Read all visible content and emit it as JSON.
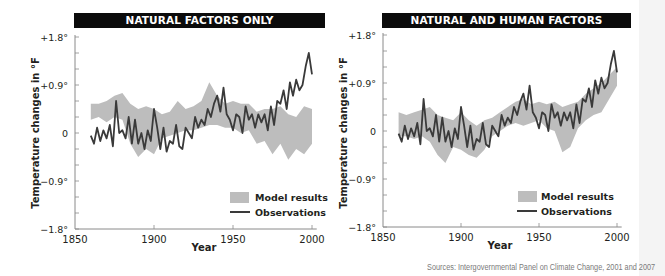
{
  "chart_data": [
    {
      "type": "line",
      "title": "NATURAL FACTORS ONLY",
      "xlabel": "Year",
      "ylabel": "Temperature changes in °F",
      "xlim": [
        1850,
        2005
      ],
      "ylim": [
        -1.8,
        1.8
      ],
      "x_ticks": [
        "1850",
        "1900",
        "1950",
        "2000"
      ],
      "y_ticks": [
        "+1.8°",
        "+0.9°",
        "0",
        "-0.9°",
        "-1.8°"
      ],
      "grid": false,
      "legend": {
        "position": "lower right",
        "entries": [
          "Model results",
          "Observations"
        ]
      },
      "series": [
        {
          "name": "Observations",
          "style": "line",
          "color": "#3a3a3a",
          "x": [
            1860,
            1862,
            1864,
            1866,
            1868,
            1870,
            1872,
            1874,
            1876,
            1878,
            1880,
            1882,
            1884,
            1886,
            1888,
            1890,
            1892,
            1894,
            1896,
            1898,
            1900,
            1902,
            1904,
            1906,
            1908,
            1910,
            1912,
            1914,
            1916,
            1918,
            1920,
            1922,
            1924,
            1926,
            1928,
            1930,
            1932,
            1934,
            1936,
            1938,
            1940,
            1942,
            1944,
            1946,
            1948,
            1950,
            1952,
            1954,
            1956,
            1958,
            1960,
            1962,
            1964,
            1966,
            1968,
            1970,
            1972,
            1974,
            1976,
            1978,
            1980,
            1982,
            1984,
            1986,
            1988,
            1990,
            1992,
            1994,
            1996,
            1998,
            2000
          ],
          "values": [
            -0.05,
            -0.2,
            0.1,
            -0.15,
            0.05,
            -0.1,
            0.15,
            -0.25,
            0.6,
            0.0,
            0.05,
            -0.1,
            0.3,
            -0.2,
            0.25,
            -0.2,
            0.0,
            -0.3,
            0.05,
            -0.15,
            0.45,
            0.1,
            -0.3,
            0.1,
            -0.35,
            -0.15,
            -0.2,
            0.15,
            -0.25,
            -0.3,
            0.1,
            0.0,
            -0.1,
            0.3,
            0.1,
            0.25,
            0.15,
            0.45,
            0.3,
            0.55,
            0.7,
            0.4,
            0.85,
            0.35,
            0.25,
            0.05,
            0.35,
            0.3,
            0.0,
            0.5,
            0.25,
            0.35,
            0.1,
            0.35,
            0.2,
            0.35,
            0.05,
            0.5,
            0.15,
            0.6,
            0.55,
            0.8,
            0.45,
            0.95,
            0.7,
            1.0,
            0.8,
            0.9,
            1.25,
            1.5,
            1.1
          ]
        },
        {
          "name": "Model results",
          "style": "band",
          "color": "#bdbdbd",
          "x": [
            1860,
            1865,
            1870,
            1875,
            1880,
            1885,
            1890,
            1895,
            1900,
            1905,
            1910,
            1915,
            1920,
            1925,
            1930,
            1935,
            1940,
            1945,
            1950,
            1955,
            1960,
            1965,
            1970,
            1975,
            1980,
            1985,
            1990,
            1995,
            2000
          ],
          "upper": [
            0.55,
            0.55,
            0.6,
            0.7,
            0.75,
            0.55,
            0.45,
            0.5,
            0.45,
            0.35,
            0.4,
            0.6,
            0.45,
            0.5,
            0.6,
            0.95,
            0.7,
            0.55,
            0.6,
            0.55,
            0.55,
            0.4,
            0.45,
            0.45,
            0.5,
            0.35,
            0.3,
            0.5,
            0.45
          ],
          "lower": [
            0.25,
            0.3,
            0.2,
            0.3,
            0.25,
            -0.2,
            -0.45,
            -0.3,
            -0.4,
            -0.1,
            -0.05,
            0.0,
            0.05,
            0.05,
            0.1,
            0.15,
            0.15,
            0.1,
            0.1,
            0.0,
            0.05,
            -0.2,
            -0.15,
            -0.4,
            -0.2,
            -0.5,
            -0.3,
            -0.4,
            -0.2
          ]
        }
      ]
    },
    {
      "type": "line",
      "title": "NATURAL AND HUMAN FACTORS",
      "xlabel": "Year",
      "ylabel": "Temperature changes in °F",
      "xlim": [
        1850,
        2005
      ],
      "ylim": [
        -1.8,
        1.8
      ],
      "x_ticks": [
        "1850",
        "1900",
        "1950",
        "2000"
      ],
      "y_ticks": [
        "+1.8°",
        "+0.9°",
        "0",
        "-0.9°",
        "-1.8°"
      ],
      "grid": false,
      "legend": {
        "position": "lower right",
        "entries": [
          "Model results",
          "Observations"
        ]
      },
      "series": [
        {
          "name": "Observations",
          "style": "line",
          "color": "#3a3a3a",
          "x": [
            1860,
            1862,
            1864,
            1866,
            1868,
            1870,
            1872,
            1874,
            1876,
            1878,
            1880,
            1882,
            1884,
            1886,
            1888,
            1890,
            1892,
            1894,
            1896,
            1898,
            1900,
            1902,
            1904,
            1906,
            1908,
            1910,
            1912,
            1914,
            1916,
            1918,
            1920,
            1922,
            1924,
            1926,
            1928,
            1930,
            1932,
            1934,
            1936,
            1938,
            1940,
            1942,
            1944,
            1946,
            1948,
            1950,
            1952,
            1954,
            1956,
            1958,
            1960,
            1962,
            1964,
            1966,
            1968,
            1970,
            1972,
            1974,
            1976,
            1978,
            1980,
            1982,
            1984,
            1986,
            1988,
            1990,
            1992,
            1994,
            1996,
            1998,
            2000
          ],
          "values": [
            -0.05,
            -0.2,
            0.1,
            -0.15,
            0.05,
            -0.1,
            0.15,
            -0.25,
            0.6,
            0.0,
            0.05,
            -0.1,
            0.3,
            -0.2,
            0.25,
            -0.2,
            0.0,
            -0.3,
            0.05,
            -0.15,
            0.45,
            0.1,
            -0.3,
            0.1,
            -0.35,
            -0.15,
            -0.2,
            0.15,
            -0.25,
            -0.3,
            0.1,
            0.0,
            -0.1,
            0.3,
            0.1,
            0.25,
            0.15,
            0.45,
            0.3,
            0.55,
            0.7,
            0.4,
            0.85,
            0.35,
            0.25,
            0.05,
            0.35,
            0.3,
            0.0,
            0.5,
            0.25,
            0.35,
            0.1,
            0.35,
            0.2,
            0.35,
            0.05,
            0.5,
            0.15,
            0.6,
            0.55,
            0.8,
            0.45,
            0.95,
            0.7,
            1.0,
            0.8,
            0.9,
            1.25,
            1.5,
            1.1
          ]
        },
        {
          "name": "Model results",
          "style": "band",
          "color": "#bdbdbd",
          "x": [
            1860,
            1865,
            1870,
            1875,
            1880,
            1885,
            1890,
            1895,
            1900,
            1905,
            1910,
            1915,
            1920,
            1925,
            1930,
            1935,
            1940,
            1945,
            1950,
            1955,
            1960,
            1965,
            1970,
            1975,
            1980,
            1985,
            1990,
            1995,
            2000
          ],
          "upper": [
            0.35,
            0.3,
            0.35,
            0.4,
            0.45,
            0.3,
            0.25,
            0.2,
            0.35,
            0.2,
            0.1,
            0.2,
            0.25,
            0.35,
            0.45,
            0.55,
            0.6,
            0.5,
            0.55,
            0.5,
            0.55,
            0.45,
            0.5,
            0.55,
            0.7,
            0.8,
            0.9,
            1.05,
            1.2
          ],
          "lower": [
            -0.1,
            -0.1,
            -0.15,
            -0.1,
            -0.2,
            -0.45,
            -0.6,
            -0.3,
            -0.35,
            -0.45,
            -0.5,
            -0.35,
            -0.1,
            0.0,
            0.1,
            0.15,
            0.1,
            0.15,
            0.2,
            0.05,
            0.0,
            -0.4,
            -0.3,
            0.05,
            0.2,
            0.3,
            0.35,
            0.6,
            0.85
          ]
        }
      ]
    }
  ],
  "panels": [
    {
      "title": "NATURAL FACTORS ONLY",
      "ylabel": "Temperature changes in °F",
      "xlabel": "Year",
      "y_ticks": [
        "+1.8°",
        "+0.9°",
        "0",
        "−0.9°",
        "−1.8°"
      ],
      "x_ticks": [
        "1850",
        "1900",
        "1950",
        "2000"
      ],
      "legend_model": "Model results",
      "legend_obs": "Observations"
    },
    {
      "title": "NATURAL AND HUMAN FACTORS",
      "ylabel": "Temperature changes in °F",
      "xlabel": "Year",
      "y_ticks": [
        "+1.8°",
        "+0.9°",
        "0",
        "−0.9°",
        "−1.8°"
      ],
      "x_ticks": [
        "1850",
        "1900",
        "1950",
        "2000"
      ],
      "legend_model": "Model results",
      "legend_obs": "Observations"
    }
  ],
  "source": "Sources: Intergovernmental Panel on Climate Change, 2001 and 2007",
  "colors": {
    "title_bar": "#0b0b0b",
    "observations": "#3a3a3a",
    "model_band": "#bdbdbd",
    "axis": "#8a8a8a"
  }
}
